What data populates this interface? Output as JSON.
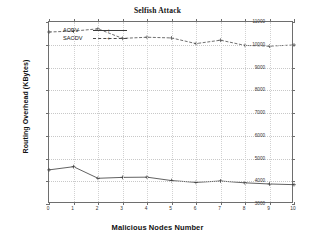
{
  "chart_data": {
    "type": "line",
    "title": "Selfish Attack",
    "xlabel": "Malicious Nodes Number",
    "ylabel": "Routing Overhead (KBytes)",
    "x": [
      0,
      1,
      2,
      3,
      4,
      5,
      6,
      7,
      8,
      9,
      10
    ],
    "xlim": [
      0,
      10
    ],
    "ylim": [
      3000,
      11000
    ],
    "xticks": [
      "0",
      "1",
      "2",
      "3",
      "4",
      "5",
      "6",
      "7",
      "8",
      "9",
      "10"
    ],
    "yticks": [
      "3000",
      "4000",
      "5000",
      "6000",
      "7000",
      "8000",
      "9000",
      "10000",
      "11000"
    ],
    "grid": true,
    "legend_position": "top-left",
    "series": [
      {
        "name": "SAODV",
        "style": "dashed",
        "marker": "+",
        "color": "#4a4a4a",
        "values": [
          10560,
          10600,
          10700,
          10280,
          10330,
          10300,
          10050,
          10200,
          9970,
          9940,
          9990
        ]
      },
      {
        "name": "AODV",
        "style": "solid",
        "marker": "+",
        "color": "#3a3a3a",
        "values": [
          4500,
          4640,
          4130,
          4170,
          4180,
          4030,
          3950,
          4010,
          3930,
          3880,
          3850
        ]
      }
    ]
  }
}
